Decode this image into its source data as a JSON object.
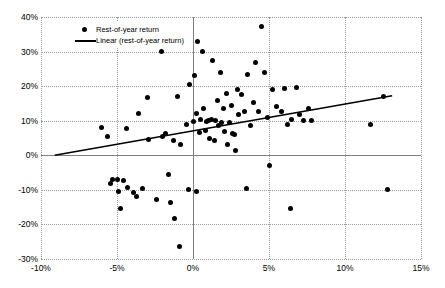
{
  "chart_data": {
    "type": "scatter",
    "title": "",
    "xlabel": "",
    "ylabel": "",
    "xlim": [
      -0.1,
      0.15
    ],
    "ylim": [
      -0.3,
      0.4
    ],
    "grid": true,
    "legend_position": "top-left",
    "x_ticks": [
      "-10%",
      "-5%",
      "0%",
      "5%",
      "10%",
      "15%"
    ],
    "x_tick_values": [
      -0.1,
      -0.05,
      0.0,
      0.05,
      0.1,
      0.15
    ],
    "y_ticks": [
      "40%",
      "30%",
      "20%",
      "10%",
      "0%",
      "-10%",
      "-20%",
      "-30%"
    ],
    "y_tick_values": [
      0.4,
      0.3,
      0.2,
      0.1,
      0.0,
      -0.1,
      -0.2,
      -0.3
    ],
    "series": [
      {
        "name": "Rest-of-year return",
        "type": "scatter",
        "marker": "circle",
        "color": "#000000",
        "points": [
          [
            -0.072,
            0.352
          ],
          [
            -0.06,
            0.079
          ],
          [
            -0.056,
            0.055
          ],
          [
            -0.054,
            -0.083
          ],
          [
            -0.053,
            -0.07
          ],
          [
            -0.05,
            -0.069
          ],
          [
            -0.049,
            -0.105
          ],
          [
            -0.048,
            -0.155
          ],
          [
            -0.046,
            -0.072
          ],
          [
            -0.044,
            0.078
          ],
          [
            -0.043,
            -0.092
          ],
          [
            -0.039,
            -0.108
          ],
          [
            -0.037,
            -0.118
          ],
          [
            -0.036,
            0.122
          ],
          [
            -0.033,
            -0.097
          ],
          [
            -0.03,
            0.168
          ],
          [
            -0.029,
            0.045
          ],
          [
            -0.024,
            -0.127
          ],
          [
            -0.021,
            0.3
          ],
          [
            -0.02,
            0.053
          ],
          [
            -0.018,
            0.063
          ],
          [
            -0.016,
            -0.055
          ],
          [
            -0.015,
            -0.137
          ],
          [
            -0.013,
            0.043
          ],
          [
            -0.012,
            -0.183
          ],
          [
            -0.01,
            0.171
          ],
          [
            -0.009,
            -0.265
          ],
          [
            -0.008,
            0.03
          ],
          [
            -0.004,
            0.089
          ],
          [
            -0.003,
            -0.1
          ],
          [
            -0.002,
            0.205
          ],
          [
            0.0,
            0.099
          ],
          [
            0.001,
            0.232
          ],
          [
            0.002,
            0.12
          ],
          [
            0.002,
            -0.105
          ],
          [
            0.003,
            0.328
          ],
          [
            0.004,
            0.065
          ],
          [
            0.005,
            0.104
          ],
          [
            0.006,
            0.3
          ],
          [
            0.007,
            0.136
          ],
          [
            0.008,
            0.072
          ],
          [
            0.009,
            0.098
          ],
          [
            0.01,
            0.1
          ],
          [
            0.011,
            0.05
          ],
          [
            0.012,
            0.104
          ],
          [
            0.013,
            0.274
          ],
          [
            0.014,
            0.042
          ],
          [
            0.015,
            0.101
          ],
          [
            0.016,
            0.159
          ],
          [
            0.017,
            0.085
          ],
          [
            0.018,
            0.24
          ],
          [
            0.019,
            0.096
          ],
          [
            0.02,
            0.134
          ],
          [
            0.021,
            0.07
          ],
          [
            0.022,
            0.178
          ],
          [
            0.023,
            0.03
          ],
          [
            0.024,
            0.096
          ],
          [
            0.025,
            0.145
          ],
          [
            0.026,
            0.062
          ],
          [
            0.027,
            0.059
          ],
          [
            0.028,
            0.014
          ],
          [
            0.029,
            0.19
          ],
          [
            0.03,
            0.118
          ],
          [
            0.032,
            0.175
          ],
          [
            0.034,
            0.128
          ],
          [
            0.035,
            -0.095
          ],
          [
            0.036,
            0.233
          ],
          [
            0.038,
            0.087
          ],
          [
            0.04,
            0.154
          ],
          [
            0.041,
            0.268
          ],
          [
            0.043,
            0.128
          ],
          [
            0.045,
            0.372
          ],
          [
            0.047,
            0.239
          ],
          [
            0.049,
            0.11
          ],
          [
            0.05,
            -0.03
          ],
          [
            0.052,
            0.19
          ],
          [
            0.055,
            0.142
          ],
          [
            0.058,
            0.128
          ],
          [
            0.06,
            0.192
          ],
          [
            0.062,
            0.088
          ],
          [
            0.064,
            -0.155
          ],
          [
            0.065,
            0.104
          ],
          [
            0.068,
            0.196
          ],
          [
            0.07,
            0.117
          ],
          [
            0.073,
            0.1
          ],
          [
            0.076,
            0.135
          ],
          [
            0.078,
            0.1
          ],
          [
            0.117,
            0.09
          ],
          [
            0.125,
            0.17
          ],
          [
            0.128,
            -0.1
          ]
        ]
      },
      {
        "name": "Linear (rest-of-year return)",
        "type": "line",
        "color": "#000000",
        "fit": "linear",
        "endpoints": [
          [
            -0.091,
            0.0
          ],
          [
            0.131,
            0.172
          ]
        ],
        "slope": 0.775,
        "intercept": 0.0705
      }
    ]
  },
  "legend": {
    "items": [
      {
        "label": "Rest-of-year return",
        "marker": "dot"
      },
      {
        "label": "Linear (rest-of-year return)",
        "marker": "line"
      }
    ]
  }
}
